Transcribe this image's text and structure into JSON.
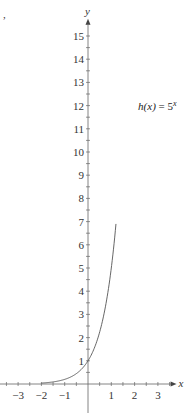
{
  "chart_data": {
    "type": "line",
    "title": "",
    "xlabel": "x",
    "ylabel": "y",
    "xlim": [
      -3.8,
      3.8
    ],
    "ylim": [
      -0.4,
      16
    ],
    "grid": false,
    "x_ticks": [
      -3,
      -2,
      -1,
      1,
      2,
      3
    ],
    "x_tick_labels": [
      "−3",
      "−2",
      "−1",
      "1",
      "2",
      "3"
    ],
    "y_ticks": [
      1,
      2,
      3,
      4,
      5,
      6,
      7,
      8,
      9,
      10,
      11,
      12,
      13,
      14,
      15
    ],
    "y_tick_labels": [
      "1",
      "2",
      "3",
      "4",
      "5",
      "6",
      "7",
      "8",
      "9",
      "10",
      "11",
      "12",
      "13",
      "14",
      "15"
    ],
    "minor_tick_step": 0.5,
    "series": [
      {
        "name": "h(x) = 5^x",
        "function": "5^x",
        "domain": [
          -2,
          1.2
        ],
        "color": "#555555"
      }
    ],
    "annotations": [
      {
        "text_func": "h",
        "text_arg": "(x)",
        "text_eq": " = 5",
        "text_exp": "x",
        "x": 2.15,
        "y": 12
      }
    ],
    "stray_mark": ","
  }
}
